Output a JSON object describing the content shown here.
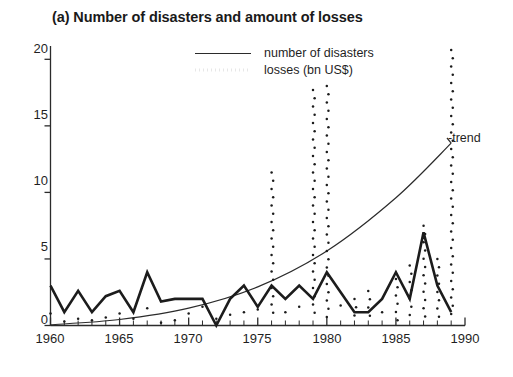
{
  "chart_data": {
    "type": "line",
    "title": "(a) Number of disasters and amount of losses",
    "xlabel": "",
    "ylabel": "",
    "xlim": [
      1960,
      1990
    ],
    "ylim": [
      0,
      21
    ],
    "yticks": [
      0,
      5,
      10,
      15,
      20
    ],
    "xticks": [
      1960,
      1965,
      1970,
      1975,
      1980,
      1985,
      1990
    ],
    "x_minor_tick_step": 1,
    "grid": false,
    "legend_position": "top-center",
    "annotations": [
      {
        "text": "-trend",
        "x": 1989.2,
        "y": 13.2
      }
    ],
    "series": [
      {
        "name": "number of disasters",
        "style": "solid-line",
        "color": "#1c1c1c",
        "x": [
          1960,
          1961,
          1962,
          1963,
          1964,
          1965,
          1966,
          1967,
          1968,
          1969,
          1970,
          1971,
          1972,
          1973,
          1974,
          1975,
          1976,
          1977,
          1978,
          1979,
          1980,
          1981,
          1982,
          1983,
          1984,
          1985,
          1986,
          1987,
          1988,
          1989
        ],
        "values": [
          3.0,
          1.0,
          2.6,
          1.0,
          2.2,
          2.6,
          1.0,
          4.0,
          1.8,
          2.0,
          2.0,
          2.0,
          0.0,
          2.0,
          3.0,
          1.4,
          3.0,
          2.0,
          3.0,
          2.0,
          4.0,
          2.5,
          1.0,
          1.0,
          2.0,
          4.0,
          2.0,
          7.0,
          3.0,
          1.0
        ]
      },
      {
        "name": "losses (bn US$)",
        "style": "dotted",
        "color": "#1c1c1c",
        "x": [
          1960,
          1961,
          1962,
          1963,
          1964,
          1965,
          1966,
          1967,
          1968,
          1969,
          1970,
          1971,
          1972,
          1973,
          1974,
          1975,
          1976,
          1977,
          1978,
          1979,
          1980,
          1981,
          1982,
          1983,
          1984,
          1985,
          1986,
          1987,
          1988,
          1989
        ],
        "values": [
          0.9,
          0.3,
          0.5,
          0.4,
          0.6,
          0.9,
          0.5,
          1.3,
          0.2,
          0.4,
          0.9,
          1.4,
          0.5,
          0.8,
          1.0,
          1.2,
          11.5,
          1.0,
          1.4,
          17.7,
          18.0,
          1.5,
          2.0,
          2.6,
          1.0,
          3.5,
          4.5,
          7.5,
          5.0,
          20.7
        ]
      },
      {
        "name": "trend",
        "style": "smooth-curve",
        "color": "#1c1c1c",
        "x": [
          1960,
          1965,
          1970,
          1975,
          1980,
          1985,
          1989
        ],
        "values": [
          0.05,
          0.45,
          1.3,
          2.9,
          5.6,
          9.6,
          13.7
        ]
      }
    ]
  },
  "legend": {
    "items": [
      {
        "label": "number of disasters",
        "key": "solid-line"
      },
      {
        "label": "losses (bn US$)",
        "key": "dotted-line"
      }
    ]
  },
  "axes": {
    "y_tick_labels": [
      "20",
      "15",
      "10",
      "5",
      "0"
    ],
    "x_tick_labels": [
      "1960",
      "1965",
      "1970",
      "1975",
      "1980",
      "1985",
      "1990"
    ]
  }
}
